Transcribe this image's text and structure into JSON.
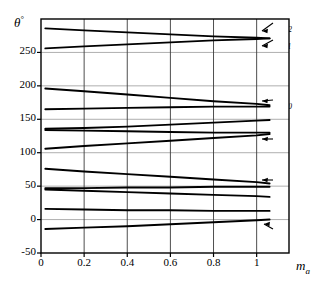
{
  "chart_data": {
    "type": "line",
    "title": "",
    "xlabel": "m_a",
    "ylabel": "theta (degrees)",
    "xlim": [
      0,
      1.15
    ],
    "ylim": [
      -50,
      300
    ],
    "grid": true,
    "legend_position": "right-inline-annotations",
    "x_ticks": [
      "0",
      "0.2",
      "0.4",
      "0.6",
      "0.8",
      "1"
    ],
    "x_tick_values": [
      0,
      0.2,
      0.4,
      0.6,
      0.8,
      1
    ],
    "y_ticks": [
      "-50",
      "0",
      "50",
      "100",
      "150",
      "200",
      "250"
    ],
    "y_tick_values": [
      -50,
      0,
      50,
      100,
      150,
      200,
      250
    ],
    "x": [
      0.02,
      0.2,
      0.4,
      0.6,
      0.8,
      1.0,
      1.06
    ],
    "series": [
      {
        "name": "theta_12",
        "label": "θ",
        "sub": "12",
        "values": [
          286,
          283,
          280,
          277,
          274,
          272,
          271
        ]
      },
      {
        "name": "theta_11",
        "label": "θ",
        "sub": "11",
        "values": [
          256,
          259,
          262,
          265,
          268,
          270,
          271
        ]
      },
      {
        "name": "theta_10",
        "label": "θ",
        "sub": "10",
        "values": [
          196,
          192,
          187,
          182,
          177,
          173,
          171
        ]
      },
      {
        "name": "theta_9",
        "label": "θ",
        "sub": "9",
        "values": [
          165,
          166,
          167,
          168,
          169,
          169,
          169
        ]
      },
      {
        "name": "theta_8",
        "label": "θ",
        "sub": "8",
        "values": [
          136,
          137,
          139,
          142,
          145,
          148,
          149
        ]
      },
      {
        "name": "theta_7",
        "label": "θ",
        "sub": "7",
        "values": [
          134,
          133,
          132,
          131,
          130,
          130,
          130
        ]
      },
      {
        "name": "theta_6",
        "label": "θ",
        "sub": "6",
        "values": [
          106,
          110,
          114,
          118,
          122,
          126,
          128
        ]
      },
      {
        "name": "theta_5",
        "label": "θ",
        "sub": "5",
        "values": [
          76,
          72,
          68,
          64,
          60,
          56,
          54
        ]
      },
      {
        "name": "theta_4",
        "label": "θ",
        "sub": "4",
        "values": [
          47,
          47,
          48,
          48,
          49,
          49,
          49
        ]
      },
      {
        "name": "theta_3",
        "label": "θ",
        "sub": "3",
        "values": [
          45,
          43,
          41,
          39,
          37,
          35,
          34
        ]
      },
      {
        "name": "theta_2",
        "label": "θ",
        "sub": "2",
        "values": [
          16,
          15,
          14,
          14,
          13,
          13,
          13
        ]
      },
      {
        "name": "theta_1",
        "label": "θ",
        "sub": "1",
        "values": [
          -14,
          -12,
          -10,
          -7,
          -4,
          -1,
          0
        ]
      }
    ],
    "annotations": [
      {
        "name": "theta_12",
        "label": "θ",
        "sub": "12",
        "x_px": 278,
        "y_px": 27,
        "arrow": true,
        "ax_px": 262,
        "ay_px": 31
      },
      {
        "name": "theta_11",
        "label": "θ",
        "sub": "11",
        "x_px": 278,
        "y_px": 44,
        "arrow": true,
        "ax_px": 262,
        "ay_px": 46
      },
      {
        "name": "theta_10",
        "label": "θ",
        "sub": "10",
        "x_px": 278,
        "y_px": 104,
        "arrow": true,
        "ax_px": 262,
        "ay_px": 101
      },
      {
        "name": "theta_8",
        "label": "θ",
        "sub": "8",
        "x_px": 278,
        "y_px": 123,
        "arrow": false,
        "ax_px": 0,
        "ay_px": 0
      },
      {
        "name": "theta_6",
        "label": "θ",
        "sub": "6",
        "x_px": 278,
        "y_px": 143,
        "arrow": true,
        "ax_px": 262,
        "ay_px": 139
      },
      {
        "name": "theta_5",
        "label": "θ",
        "sub": "5",
        "x_px": 278,
        "y_px": 184,
        "arrow": true,
        "ax_px": 262,
        "ay_px": 180
      },
      {
        "name": "theta_3",
        "label": "θ",
        "sub": "3",
        "x_px": 278,
        "y_px": 205,
        "arrow": false,
        "ax_px": 0,
        "ay_px": 0
      },
      {
        "name": "theta_1",
        "label": "θ",
        "sub": "1",
        "x_px": 278,
        "y_px": 233,
        "arrow": true,
        "ax_px": 264,
        "ay_px": 224
      }
    ]
  },
  "axes": {
    "y_axis_title": "θ",
    "y_axis_title_sup": "°",
    "x_axis_title": "m",
    "x_axis_title_sub": "a"
  }
}
